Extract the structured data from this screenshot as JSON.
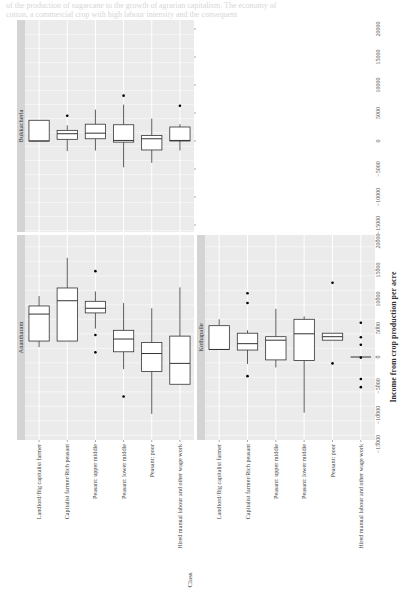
{
  "chart_data": {
    "type": "box",
    "orientation": "rotated-90-ccw",
    "title": "",
    "xlabel": "Class",
    "ylabel": "Income from crop production per acre",
    "ylim": [
      -16000,
      21000
    ],
    "ticks": [
      -15000,
      -10000,
      -5000,
      0,
      5000,
      10000,
      15000,
      20000
    ],
    "tick_labels": [
      "−15000",
      "−10000",
      "−5000",
      "0",
      "5000",
      "10000",
      "15000",
      "20000"
    ],
    "grid": true,
    "categories": [
      "Landlord/Big capitalist farmer",
      "Capitalist farmer/Rich peasant",
      "Peasant: upper middle",
      "Peasant: lower middle",
      "Peasant: poor",
      "Hired manual labour and other wage work"
    ],
    "panels": [
      {
        "name": "Bukkacherla",
        "boxes": [
          {
            "q1": 0,
            "median": 0,
            "q3": 3700,
            "wlo": 0,
            "whi": 3700,
            "outliers": []
          },
          {
            "q1": 300,
            "median": 1300,
            "q3": 1900,
            "wlo": -1800,
            "whi": 2800,
            "outliers": [
              4500
            ]
          },
          {
            "q1": 400,
            "median": 1400,
            "q3": 3000,
            "wlo": -1700,
            "whi": 5600,
            "outliers": []
          },
          {
            "q1": -200,
            "median": 100,
            "q3": 2900,
            "wlo": -4700,
            "whi": 6500,
            "outliers": [
              8100
            ]
          },
          {
            "q1": -1600,
            "median": 400,
            "q3": 1000,
            "wlo": -3900,
            "whi": 4000,
            "outliers": []
          },
          {
            "q1": 0,
            "median": 100,
            "q3": 2500,
            "wlo": -1700,
            "whi": 3000,
            "outliers": [
              6300
            ]
          }
        ]
      },
      {
        "name": "Anantharam",
        "boxes": [
          {
            "q1": 2750,
            "median": 7400,
            "q3": 8800,
            "wlo": 1700,
            "whi": 10500,
            "outliers": []
          },
          {
            "q1": 2750,
            "median": 9700,
            "q3": 11900,
            "wlo": 2750,
            "whi": 17100,
            "outliers": []
          },
          {
            "q1": 7600,
            "median": 8400,
            "q3": 9600,
            "wlo": 4900,
            "whi": 11300,
            "outliers": [
              14800,
              3800,
              800
            ]
          },
          {
            "q1": 900,
            "median": 3100,
            "q3": 4600,
            "wlo": -2100,
            "whi": 9300,
            "outliers": [
              -6800
            ]
          },
          {
            "q1": -2500,
            "median": 600,
            "q3": 2500,
            "wlo": -9800,
            "whi": 8400,
            "outliers": []
          },
          {
            "q1": -4700,
            "median": -1100,
            "q3": 3600,
            "wlo": -4700,
            "whi": 12000,
            "outliers": []
          }
        ]
      },
      {
        "name": "Kothapalle",
        "boxes": [
          {
            "q1": 1300,
            "median": 1300,
            "q3": 5400,
            "wlo": 1300,
            "whi": 6500,
            "outliers": []
          },
          {
            "q1": 1200,
            "median": 2300,
            "q3": 4100,
            "wlo": -1200,
            "whi": 4600,
            "outliers": [
              11000,
              9300,
              -3300
            ]
          },
          {
            "q1": -500,
            "median": 2900,
            "q3": 3500,
            "wlo": -1800,
            "whi": 8300,
            "outliers": []
          },
          {
            "q1": -600,
            "median": 4000,
            "q3": 6500,
            "wlo": -9600,
            "whi": 7000,
            "outliers": []
          },
          {
            "q1": 2900,
            "median": 3500,
            "q3": 4100,
            "wlo": 2900,
            "whi": 4100,
            "outliers": [
              12800,
              -1100
            ]
          },
          {
            "q1": 0,
            "median": 0,
            "q3": 0,
            "wlo": 0,
            "whi": 0,
            "outliers": [
              5900,
              3400,
              2100,
              -100,
              -3800,
              -5200
            ]
          }
        ]
      }
    ]
  },
  "page": {
    "bleed_text_1": "of the production of sugarcane to the growth of agrarian capitalism. The economy of",
    "bleed_text_2": "cotton, a commercial crop with high labour intensity and the consequent",
    "bleed_text_3": "in agriculture of landowning households"
  }
}
